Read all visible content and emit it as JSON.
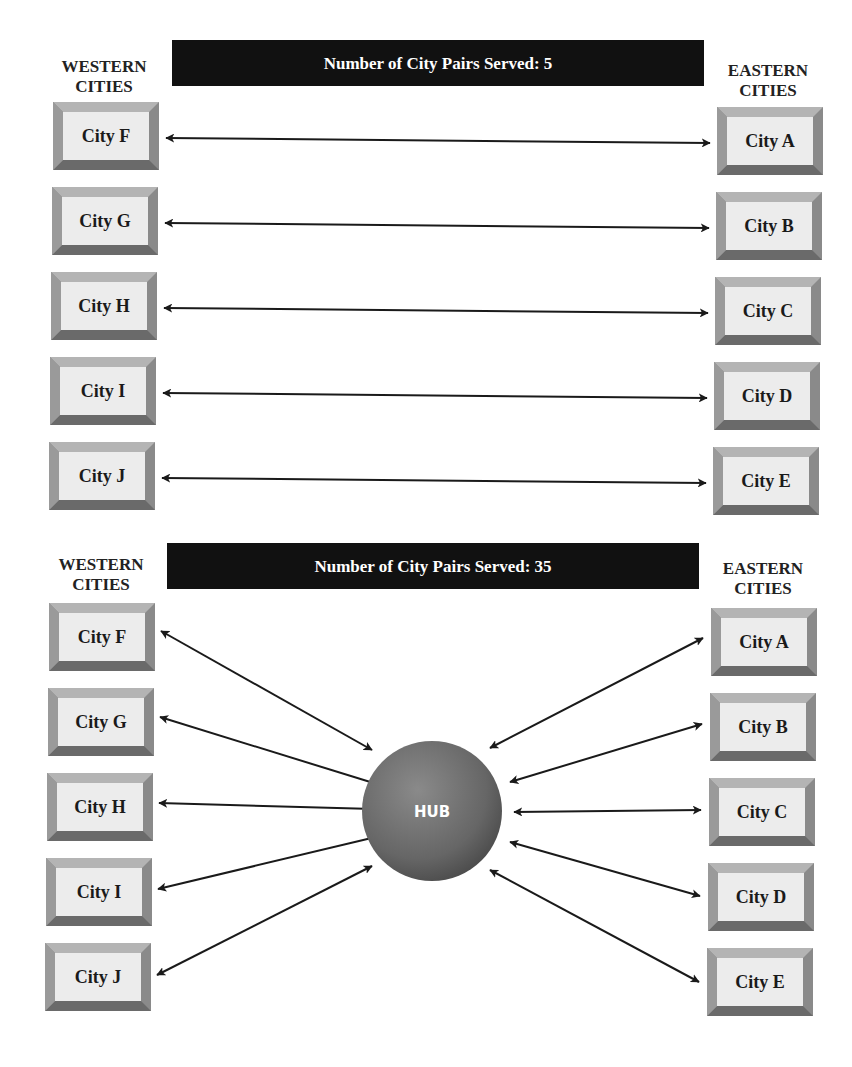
{
  "panels": [
    {
      "banner": "Number of City Pairs Served: 5",
      "west_header": [
        "WESTERN",
        "CITIES"
      ],
      "east_header": [
        "EASTERN",
        "CITIES"
      ],
      "west_cities": [
        "City F",
        "City G",
        "City H",
        "City I",
        "City J"
      ],
      "east_cities": [
        "City A",
        "City B",
        "City C",
        "City D",
        "City E"
      ],
      "topology": "point-to-point"
    },
    {
      "banner": "Number of City Pairs Served: 35",
      "west_header": [
        "WESTERN",
        "CITIES"
      ],
      "east_header": [
        "EASTERN",
        "CITIES"
      ],
      "west_cities": [
        "City F",
        "City G",
        "City H",
        "City I",
        "City J"
      ],
      "east_cities": [
        "City A",
        "City B",
        "City C",
        "City D",
        "City E"
      ],
      "hub_label": "HUB",
      "topology": "hub-and-spoke"
    }
  ],
  "colors": {
    "banner": "#111111",
    "box_face": "#ececec",
    "box_bevel": "#8a8a8a",
    "hub": "#6e6e6e"
  }
}
